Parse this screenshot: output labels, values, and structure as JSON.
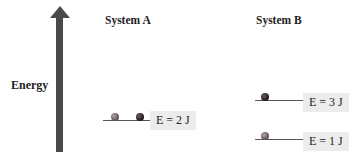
{
  "axis": {
    "label": "Energy",
    "direction": "up"
  },
  "systems": [
    {
      "title": "System A",
      "levels": [
        {
          "label": "E = 2 J",
          "particles": 2
        }
      ]
    },
    {
      "title": "System B",
      "levels": [
        {
          "label": "E = 3 J",
          "particles": 1
        },
        {
          "label": "E = 1 J",
          "particles": 1
        }
      ]
    }
  ],
  "colors": {
    "arrow": "#4a4a4a",
    "label_bg": "#ececec",
    "level_line": "#555555"
  }
}
